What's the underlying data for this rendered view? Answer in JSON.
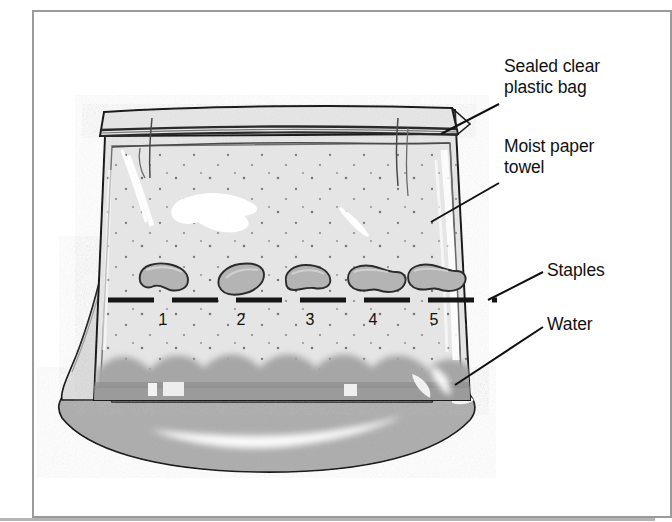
{
  "figure": {
    "kind": "science-diagram",
    "frame_border_color": "#9a9a9a",
    "background_color": "#ffffff"
  },
  "callouts": [
    {
      "id": "sealed-bag",
      "text": "Sealed clear\nplastic bag",
      "leader_from": [
        499,
        104
      ],
      "leader_to": [
        441,
        134
      ]
    },
    {
      "id": "paper-towel",
      "text": "Moist paper\ntowel",
      "leader_from": [
        499,
        183
      ],
      "leader_to": [
        431,
        222
      ]
    },
    {
      "id": "staples",
      "text": "Staples",
      "leader_from": [
        543,
        272
      ],
      "leader_to": [
        488,
        300
      ]
    },
    {
      "id": "water",
      "text": "Water",
      "leader_from": [
        543,
        327
      ],
      "leader_to": [
        455,
        385
      ]
    }
  ],
  "seeds": [
    {
      "number": "1",
      "cx": 163,
      "cy": 279
    },
    {
      "number": "2",
      "cx": 241,
      "cy": 283
    },
    {
      "number": "3",
      "cx": 310,
      "cy": 282
    },
    {
      "number": "4",
      "cx": 373,
      "cy": 283
    },
    {
      "number": "5",
      "cx": 434,
      "cy": 281
    }
  ],
  "seed_number_row_y": 321,
  "colors": {
    "outline": "#1a1a1a",
    "bag_interior": "#ececec",
    "paper_towel": "#e4e4e4",
    "water": "#a9a9a9",
    "water_lower": "#9d9d9d",
    "seed_fill": "#b3b3b3",
    "seed_outline": "#2b2b2b",
    "staple_mark": "#1a1a1a",
    "highlight": "#ffffff",
    "speckle": "#5a5a5a",
    "label_text": "#111111"
  },
  "staple_line": {
    "y": 300,
    "x_start": 108,
    "x_end": 497,
    "dash_pattern": "long dashes"
  }
}
